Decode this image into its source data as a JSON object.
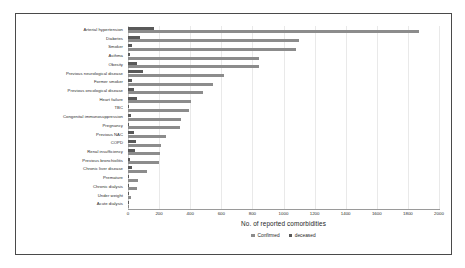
{
  "chart_data": {
    "type": "bar",
    "orientation": "horizontal",
    "title": "",
    "xlabel": "No. of reported comorbidities",
    "ylabel": "",
    "xlim": [
      0,
      2000
    ],
    "xticks": [
      0,
      200,
      400,
      600,
      800,
      1000,
      1200,
      1400,
      1600,
      1800,
      2000
    ],
    "grid": true,
    "legend_position": "bottom-center",
    "categories": [
      "Arterial hypertension",
      "Diabetes",
      "Smoker",
      "Asthma",
      "Obesity",
      "Previous neurological disease",
      "Former smoker",
      "Previous oncological disease",
      "Heart failure",
      "TBC",
      "Congenital immunosuppression",
      "Pregnancy",
      "Previous NAC",
      "COPD",
      "Renal insufficiency",
      "Previous bronchiolitis",
      "Chronic liver disease",
      "Premature",
      "Chronic dialysis",
      "Under weight",
      "Acute dialysis"
    ],
    "series": [
      {
        "name": "Confirmed",
        "color": "#8c8c8c",
        "values": [
          1870,
          1100,
          1080,
          845,
          840,
          620,
          545,
          480,
          405,
          395,
          340,
          335,
          245,
          215,
          205,
          200,
          120,
          65,
          55,
          20,
          8
        ]
      },
      {
        "name": "deceased",
        "color": "#595959",
        "values": [
          170,
          75,
          25,
          10,
          55,
          95,
          25,
          40,
          60,
          8,
          20,
          5,
          40,
          50,
          45,
          12,
          25,
          5,
          6,
          4,
          2
        ]
      }
    ]
  },
  "legend": {
    "items": [
      {
        "label": "Confirmed",
        "color": "#8c8c8c"
      },
      {
        "label": "deceased",
        "color": "#595959"
      }
    ]
  }
}
